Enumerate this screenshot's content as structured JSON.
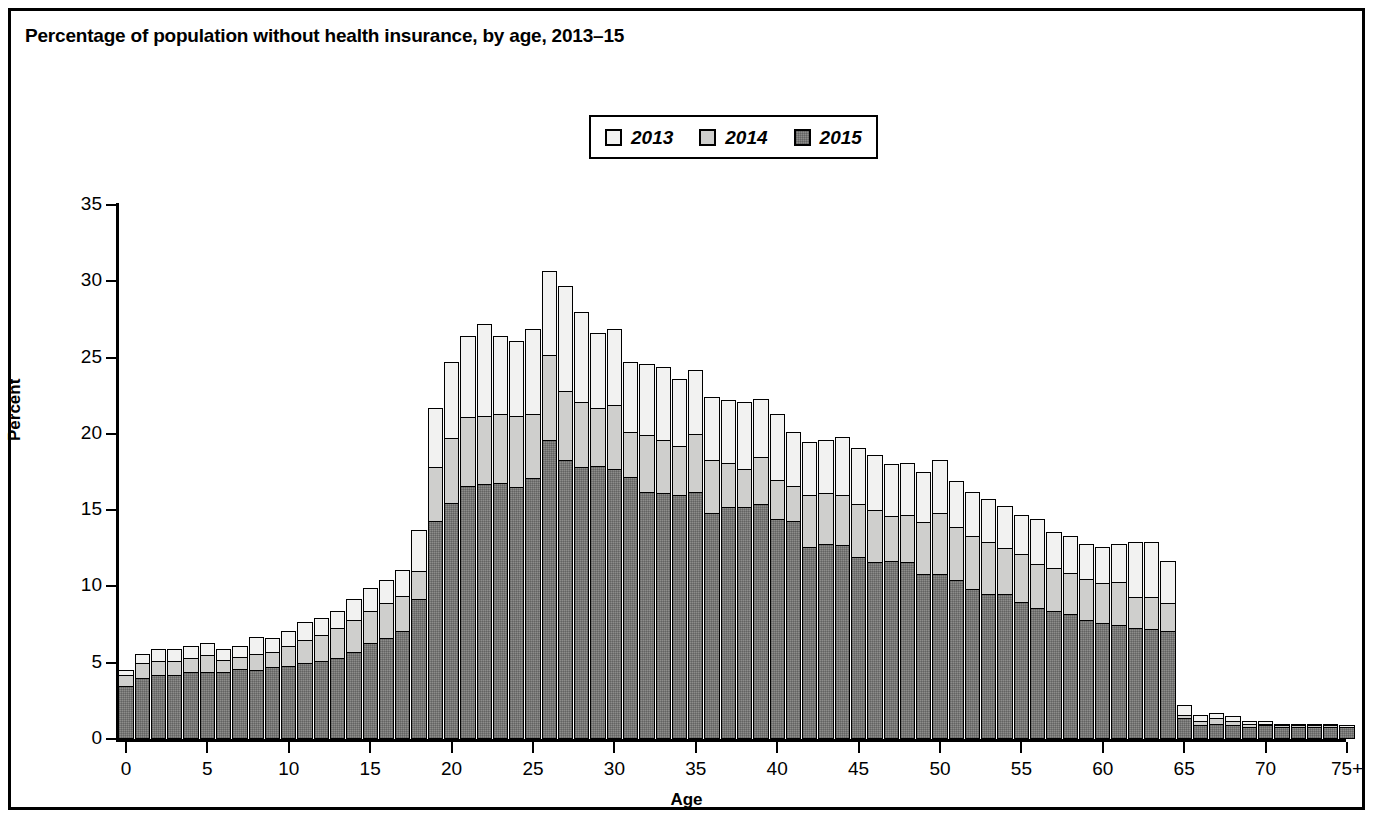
{
  "figure": {
    "title": "Percentage of population without health insurance, by age, 2013–15"
  },
  "legend": {
    "position": "top-center",
    "items": [
      {
        "label": "2013",
        "color": "#f2f2f1"
      },
      {
        "label": "2014",
        "color": "#cfcfcd"
      },
      {
        "label": "2015",
        "color": "#8d8d8b"
      }
    ]
  },
  "axes": {
    "ylabel": "Percent",
    "xlabel": "Age",
    "yticks": [
      "0",
      "5",
      "10",
      "15",
      "20",
      "25",
      "30",
      "35"
    ],
    "xticks": [
      "0",
      "5",
      "10",
      "15",
      "20",
      "25",
      "30",
      "35",
      "40",
      "45",
      "50",
      "55",
      "60",
      "65",
      "70",
      "75+"
    ]
  },
  "chart_data": {
    "type": "bar",
    "title": "Percentage of population without health insurance, by age, 2013–15",
    "xlabel": "Age",
    "ylabel": "Percent",
    "ylim": [
      0,
      35
    ],
    "xlim": [
      0,
      75
    ],
    "grid": false,
    "legend_position": "top-center",
    "note": "Overlapping bars: each age shows three nested bars, 2013 tallest (outermost), then 2014, then 2015 (innermost/darkest).",
    "categories": [
      "0",
      "1",
      "2",
      "3",
      "4",
      "5",
      "6",
      "7",
      "8",
      "9",
      "10",
      "11",
      "12",
      "13",
      "14",
      "15",
      "16",
      "17",
      "18",
      "19",
      "20",
      "21",
      "22",
      "23",
      "24",
      "25",
      "26",
      "27",
      "28",
      "29",
      "30",
      "31",
      "32",
      "33",
      "34",
      "35",
      "36",
      "37",
      "38",
      "39",
      "40",
      "41",
      "42",
      "43",
      "44",
      "45",
      "46",
      "47",
      "48",
      "49",
      "50",
      "51",
      "52",
      "53",
      "54",
      "55",
      "56",
      "57",
      "58",
      "59",
      "60",
      "61",
      "62",
      "63",
      "64",
      "65",
      "66",
      "67",
      "68",
      "69",
      "70",
      "71",
      "72",
      "73",
      "74",
      "75+"
    ],
    "series": [
      {
        "name": "2013",
        "color": "#f2f2f1",
        "values": [
          4.5,
          5.6,
          5.9,
          5.9,
          6.1,
          6.3,
          5.9,
          6.1,
          6.7,
          6.6,
          7.1,
          7.7,
          7.9,
          8.4,
          9.2,
          9.9,
          10.4,
          11.1,
          13.7,
          21.7,
          24.7,
          26.4,
          27.2,
          26.4,
          26.1,
          26.9,
          30.7,
          29.7,
          28.0,
          26.6,
          26.9,
          24.7,
          24.6,
          24.4,
          23.6,
          24.2,
          22.4,
          22.2,
          22.1,
          22.3,
          21.3,
          20.1,
          19.5,
          19.6,
          19.8,
          19.1,
          18.6,
          18.0,
          18.1,
          17.5,
          18.3,
          16.9,
          16.2,
          15.7,
          15.3,
          14.7,
          14.4,
          13.6,
          13.3,
          12.8,
          12.6,
          12.8,
          12.9,
          12.9,
          11.7,
          2.2,
          1.6,
          1.7,
          1.5,
          1.2,
          1.2,
          1.0,
          1.0,
          1.0,
          1.0,
          0.9
        ]
      },
      {
        "name": "2014",
        "color": "#cfcfcd",
        "values": [
          4.2,
          5.0,
          5.1,
          5.1,
          5.3,
          5.5,
          5.2,
          5.4,
          5.6,
          5.7,
          6.1,
          6.5,
          6.8,
          7.3,
          7.8,
          8.4,
          8.9,
          9.4,
          11.0,
          17.8,
          19.7,
          21.1,
          21.2,
          21.3,
          21.2,
          21.3,
          25.2,
          22.8,
          22.1,
          21.7,
          21.9,
          20.1,
          19.9,
          19.6,
          19.2,
          20.0,
          18.3,
          18.1,
          17.7,
          18.5,
          17.0,
          16.6,
          16.0,
          16.1,
          16.0,
          15.4,
          15.0,
          14.6,
          14.7,
          14.2,
          14.8,
          13.9,
          13.3,
          12.9,
          12.5,
          12.1,
          11.5,
          11.2,
          10.9,
          10.5,
          10.2,
          10.3,
          9.3,
          9.3,
          8.9,
          1.6,
          1.2,
          1.4,
          1.2,
          1.0,
          1.0,
          0.9,
          0.9,
          0.9,
          0.9,
          0.8
        ]
      },
      {
        "name": "2015",
        "color": "#8d8d8b",
        "values": [
          3.5,
          4.0,
          4.2,
          4.2,
          4.4,
          4.4,
          4.4,
          4.6,
          4.5,
          4.7,
          4.8,
          5.0,
          5.1,
          5.3,
          5.7,
          6.3,
          6.6,
          7.1,
          9.2,
          14.3,
          15.5,
          16.6,
          16.7,
          16.8,
          16.5,
          17.1,
          19.6,
          18.3,
          17.8,
          17.9,
          17.7,
          17.2,
          16.2,
          16.1,
          16.0,
          16.2,
          14.8,
          15.2,
          15.2,
          15.4,
          14.4,
          14.3,
          12.6,
          12.8,
          12.7,
          11.9,
          11.6,
          11.7,
          11.6,
          10.8,
          10.8,
          10.4,
          9.8,
          9.5,
          9.5,
          9.0,
          8.6,
          8.4,
          8.2,
          7.8,
          7.6,
          7.5,
          7.3,
          7.2,
          7.1,
          1.4,
          0.9,
          1.0,
          0.9,
          0.8,
          0.9,
          0.8,
          0.8,
          0.8,
          0.8,
          0.8
        ]
      }
    ]
  }
}
